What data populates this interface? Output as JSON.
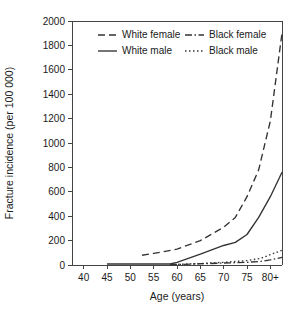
{
  "chart_data": {
    "type": "line",
    "title": "",
    "xlabel": "Age (years)",
    "ylabel": "Fracture incidence (per 100 000)",
    "xlim": [
      37.5,
      82.5
    ],
    "ylim": [
      0,
      2000
    ],
    "grid": false,
    "legend_position": "top-center",
    "x_tick_labels": [
      "40",
      "45",
      "50",
      "55",
      "60",
      "65",
      "70",
      "75",
      "80+"
    ],
    "x_tick_values": [
      40,
      45,
      50,
      55,
      60,
      65,
      70,
      75,
      80
    ],
    "y_tick_labels": [
      "0",
      "200",
      "400",
      "600",
      "800",
      "1000",
      "1200",
      "1400",
      "1600",
      "1800",
      "2000"
    ],
    "y_tick_values": [
      0,
      200,
      400,
      600,
      800,
      1000,
      1200,
      1400,
      1600,
      1800,
      2000
    ],
    "x": [
      40,
      45,
      50,
      55,
      60,
      65,
      70,
      75,
      80,
      82.5
    ],
    "series": [
      {
        "name": "White female",
        "style": "dashed",
        "dash": "7,4",
        "x": [
          52.5,
          55,
          60,
          65,
          70,
          72.5,
          75,
          77.5,
          80,
          82.5
        ],
        "values": [
          80,
          95,
          130,
          200,
          310,
          390,
          560,
          780,
          1180,
          1900
        ]
      },
      {
        "name": "White male",
        "style": "solid",
        "dash": "none",
        "x": [
          45,
          50,
          55,
          58.5,
          60,
          65,
          70,
          72.5,
          75,
          77.5,
          80,
          82.5
        ],
        "values": [
          8,
          8,
          8,
          8,
          22,
          90,
          160,
          185,
          250,
          390,
          560,
          760
        ]
      },
      {
        "name": "Black female",
        "style": "dash-dot",
        "dash": "7,2.5,1.5,2.5",
        "x": [
          58.5,
          60,
          65,
          70,
          75,
          78,
          80,
          82.5
        ],
        "values": [
          2,
          4,
          10,
          16,
          22,
          30,
          42,
          62
        ]
      },
      {
        "name": "Black male",
        "style": "dotted",
        "dash": "1.5,2.5",
        "x": [
          58.5,
          60,
          65,
          70,
          75,
          78,
          80,
          82.5
        ],
        "values": [
          2,
          5,
          12,
          22,
          36,
          55,
          85,
          120
        ]
      }
    ]
  },
  "legend": {
    "entries": [
      {
        "label": "White female"
      },
      {
        "label": "Black female"
      },
      {
        "label": "White male"
      },
      {
        "label": "Black male"
      }
    ]
  },
  "colors": {
    "line": "#333333",
    "axis": "#444444",
    "text": "#1a1a1a",
    "background": "#ffffff"
  }
}
